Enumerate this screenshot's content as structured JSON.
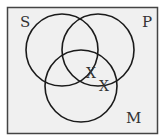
{
  "diagram": {
    "type": "venn",
    "colors": {
      "frame": "#444444",
      "background": "#f0f0f0",
      "circle": "#1a1a1a",
      "text": "#333333"
    },
    "frame": {
      "x": 7.5,
      "y": 7.5,
      "width": 150,
      "height": 126
    },
    "sets": [
      {
        "label": "S",
        "cx": 62,
        "cy": 50,
        "r": 36,
        "label_x": 20,
        "label_y": 27
      },
      {
        "label": "P",
        "cx": 98,
        "cy": 50,
        "r": 36,
        "label_x": 142,
        "label_y": 27
      },
      {
        "label": "M",
        "cx": 81,
        "cy": 86,
        "r": 36,
        "label_x": 126,
        "label_y": 123
      }
    ],
    "marks": [
      {
        "symbol": "X",
        "x": 91,
        "y": 78,
        "region": "S∩P∩M boundary (P and M, near S edge)"
      },
      {
        "symbol": "X",
        "x": 104,
        "y": 91,
        "region": "P∩M boundary (on P edge)"
      }
    ]
  }
}
